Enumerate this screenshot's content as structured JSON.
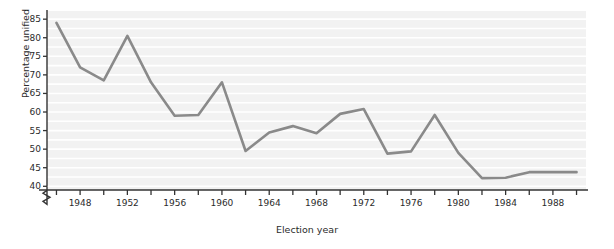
{
  "chart_data": {
    "type": "line",
    "title": "",
    "xlabel": "Election year",
    "ylabel": "Percentage unified",
    "xlim": [
      1945,
      1991
    ],
    "ylim": [
      40,
      87
    ],
    "y_axis_break": true,
    "grid": true,
    "grid_orientation": "horizontal",
    "legend": null,
    "line_color": "#8a8a8a",
    "plot_background": "#f2f2f2",
    "x_major_ticks": [
      1948,
      1952,
      1956,
      1960,
      1964,
      1968,
      1972,
      1976,
      1980,
      1984,
      1988
    ],
    "x_minor_ticks": [
      1946,
      1950,
      1954,
      1958,
      1962,
      1966,
      1970,
      1974,
      1978,
      1982,
      1986,
      1990
    ],
    "y_ticks": [
      40,
      45,
      50,
      55,
      60,
      65,
      70,
      75,
      80,
      85
    ],
    "x": [
      1946,
      1948,
      1950,
      1952,
      1954,
      1956,
      1958,
      1960,
      1962,
      1964,
      1966,
      1968,
      1970,
      1972,
      1974,
      1976,
      1978,
      1980,
      1982,
      1984,
      1986,
      1988,
      1990
    ],
    "values": [
      84.0,
      72.0,
      68.5,
      80.5,
      68.0,
      59.0,
      59.2,
      68.0,
      49.5,
      54.5,
      56.2,
      54.3,
      59.5,
      60.8,
      48.8,
      49.4,
      59.2,
      49.0,
      42.2,
      42.3,
      43.8,
      43.8,
      43.8
    ],
    "points": [
      {
        "year": 1946,
        "value": 84.0
      },
      {
        "year": 1948,
        "value": 72.0
      },
      {
        "year": 1950,
        "value": 68.5
      },
      {
        "year": 1952,
        "value": 80.5
      },
      {
        "year": 1954,
        "value": 68.0
      },
      {
        "year": 1956,
        "value": 59.0
      },
      {
        "year": 1958,
        "value": 59.2
      },
      {
        "year": 1960,
        "value": 68.0
      },
      {
        "year": 1962,
        "value": 49.5
      },
      {
        "year": 1964,
        "value": 54.5
      },
      {
        "year": 1966,
        "value": 56.2
      },
      {
        "year": 1968,
        "value": 54.3
      },
      {
        "year": 1970,
        "value": 59.5
      },
      {
        "year": 1972,
        "value": 60.8
      },
      {
        "year": 1974,
        "value": 48.8
      },
      {
        "year": 1976,
        "value": 49.4
      },
      {
        "year": 1978,
        "value": 59.2
      },
      {
        "year": 1980,
        "value": 49.0
      },
      {
        "year": 1982,
        "value": 42.2
      },
      {
        "year": 1984,
        "value": 42.3
      },
      {
        "year": 1986,
        "value": 43.8
      },
      {
        "year": 1988,
        "value": 43.8
      }
    ]
  },
  "axis": {
    "y_title": "Percentage unified",
    "x_title": "Election year",
    "y_tick_labels": [
      "40",
      "45",
      "50",
      "55",
      "60",
      "65",
      "70",
      "75",
      "80",
      "85"
    ],
    "x_tick_labels": [
      "1948",
      "1952",
      "1956",
      "1960",
      "1964",
      "1968",
      "1972",
      "1976",
      "1980",
      "1984",
      "1988"
    ]
  }
}
